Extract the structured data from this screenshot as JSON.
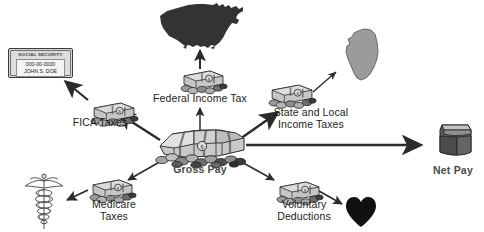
{
  "diagram": {
    "background_color": "#ffffff",
    "center": {
      "label": "Gross Pay",
      "icon": "money-stack-icon",
      "label_color": "#4a4a4a"
    },
    "result": {
      "label": "Net Pay",
      "icon": "wallet-icon",
      "label_color": "#4a4a4a"
    },
    "branches": [
      {
        "id": "fica",
        "label": "FICA Taxes",
        "lines": [
          "FICA Taxes"
        ],
        "money_icon": "money-bundle-icon",
        "target_icon": "social-security-card-icon"
      },
      {
        "id": "federal",
        "label": "Federal Income Tax",
        "lines": [
          "Federal Income Tax"
        ],
        "money_icon": "money-bundle-icon",
        "target_icon": "usa-map-icon"
      },
      {
        "id": "state-local",
        "label": "State and Local Income Taxes",
        "lines": [
          "State and Local",
          "Income Taxes"
        ],
        "money_icon": "money-bundle-icon",
        "target_icon": "state-map-icon"
      },
      {
        "id": "medicare",
        "label": "Medicare Taxes",
        "lines": [
          "Medicare",
          "Taxes"
        ],
        "money_icon": "money-bundle-icon",
        "target_icon": "caduceus-icon"
      },
      {
        "id": "voluntary",
        "label": "Voluntary Deductions",
        "lines": [
          "Voluntary",
          "Deductions"
        ],
        "money_icon": "money-bundle-icon",
        "target_icon": "heart-icon"
      }
    ],
    "social_security_card": {
      "header": "SOCIAL SECURITY",
      "number": "000-00-0000",
      "name": "JOHN S. DOE"
    },
    "colors": {
      "map_fill": "#333333",
      "state_fill": "#9b9b9b",
      "heart_fill": "#111111",
      "money_fill": "#c9c9c9",
      "arrow": "#2b2b2b",
      "text": "#1d1d1d",
      "bold_text": "#4a4a4a"
    }
  }
}
